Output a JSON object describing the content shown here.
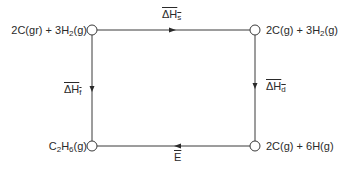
{
  "diagram": {
    "type": "thermochemical-cycle",
    "nodes": {
      "top_left": {
        "label": "2C(gr) + 3H",
        "sub": "2",
        "suffix": "(g)"
      },
      "top_right": {
        "label": "2C(g) + 3H",
        "sub": "2",
        "suffix": "(g)"
      },
      "bottom_left": {
        "label": "C",
        "sub1": "2",
        "mid": "H",
        "sub2": "6",
        "suffix": "(g)"
      },
      "bottom_right": {
        "label": "2C(g) + 6H(g)"
      }
    },
    "edges": {
      "top": {
        "symbol": "ΔH",
        "sub": "s",
        "from": "top_left",
        "to": "top_right"
      },
      "left": {
        "symbol": "ΔH",
        "sub": "f",
        "from": "top_left",
        "to": "bottom_left"
      },
      "right": {
        "symbol": "ΔH",
        "sub": "d",
        "from": "top_right",
        "to": "bottom_right"
      },
      "bottom": {
        "symbol": "E",
        "from": "bottom_right",
        "to": "bottom_left"
      }
    },
    "colors": {
      "line": "#3a3a3a",
      "text": "#2a2a2a",
      "background": "#ffffff"
    }
  }
}
